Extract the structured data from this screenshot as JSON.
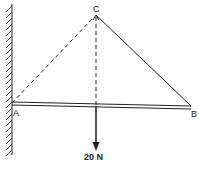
{
  "diagram": {
    "points": {
      "A": {
        "label": "A",
        "x": 12,
        "y": 103
      },
      "B": {
        "label": "B",
        "x": 191,
        "y": 107
      },
      "C": {
        "label": "C",
        "x": 96,
        "y": 15
      }
    },
    "load": {
      "label": "20 N",
      "x": 96
    },
    "elements": [
      "wall",
      "beam AB",
      "string CB",
      "dashed AC",
      "dashed vertical at C",
      "load arrow 20 N"
    ],
    "colors": {
      "ink": "#222222"
    }
  }
}
